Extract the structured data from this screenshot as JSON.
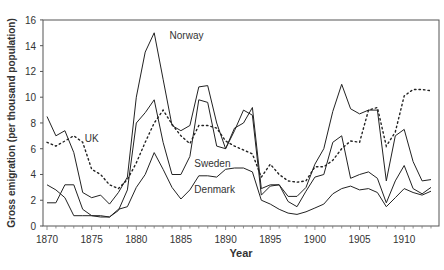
{
  "chart_data": {
    "type": "line",
    "title": "",
    "xlabel": "Year",
    "ylabel": "Gross emigration (per thousand population)",
    "xlim": [
      1870,
      1913
    ],
    "ylim": [
      0,
      16
    ],
    "x_ticks": [
      "1870",
      "1875",
      "1880",
      "1885",
      "1890",
      "1895",
      "1900",
      "1905",
      "1910"
    ],
    "y_ticks": [
      "0",
      "2",
      "4",
      "6",
      "8",
      "10",
      "12",
      "14",
      "16"
    ],
    "grid": false,
    "legend": "inline labels",
    "x": [
      1870,
      1871,
      1872,
      1873,
      1874,
      1875,
      1876,
      1877,
      1878,
      1879,
      1880,
      1881,
      1882,
      1883,
      1884,
      1885,
      1886,
      1887,
      1888,
      1889,
      1890,
      1891,
      1892,
      1893,
      1894,
      1895,
      1896,
      1897,
      1898,
      1899,
      1900,
      1901,
      1902,
      1903,
      1904,
      1905,
      1906,
      1907,
      1908,
      1909,
      1910,
      1911,
      1912,
      1913
    ],
    "series": [
      {
        "name": "Norway",
        "style": "solid",
        "values": [
          8.5,
          7.0,
          7.4,
          5.7,
          2.6,
          2.2,
          2.4,
          1.7,
          2.6,
          3.8,
          10.0,
          13.5,
          15.0,
          11.4,
          7.8,
          7.4,
          7.8,
          10.8,
          10.9,
          8.0,
          6.0,
          7.6,
          8.0,
          9.2,
          2.9,
          3.2,
          3.2,
          2.3,
          2.3,
          3.0,
          4.8,
          6.0,
          8.9,
          11.0,
          9.1,
          8.7,
          9.0,
          9.0,
          3.5,
          7.0,
          7.5,
          5.0,
          3.5,
          3.6
        ]
      },
      {
        "name": "Sweden",
        "style": "solid",
        "values": [
          1.8,
          1.8,
          3.2,
          3.2,
          1.3,
          0.8,
          0.8,
          0.7,
          1.2,
          2.8,
          8.0,
          8.8,
          9.8,
          6.5,
          4.0,
          4.0,
          5.4,
          9.8,
          9.6,
          6.2,
          6.0,
          7.4,
          9.0,
          8.6,
          2.4,
          3.1,
          3.2,
          1.9,
          1.5,
          2.7,
          3.8,
          4.0,
          6.5,
          7.0,
          3.7,
          4.0,
          4.2,
          3.7,
          1.8,
          3.5,
          4.7,
          2.9,
          2.5,
          3.0
        ]
      },
      {
        "name": "Denmark",
        "style": "solid",
        "values": [
          3.2,
          2.8,
          2.2,
          0.8,
          0.8,
          0.8,
          0.7,
          0.7,
          1.3,
          1.5,
          3.0,
          4.0,
          5.7,
          4.4,
          3.0,
          2.1,
          2.8,
          3.9,
          3.9,
          3.8,
          4.4,
          4.5,
          4.5,
          4.2,
          2.0,
          1.7,
          1.3,
          1.0,
          0.9,
          1.1,
          1.4,
          1.7,
          2.5,
          2.9,
          3.1,
          2.8,
          2.9,
          2.6,
          1.5,
          2.2,
          2.9,
          2.6,
          2.4,
          2.7
        ]
      },
      {
        "name": "UK",
        "style": "dotted",
        "values": [
          6.5,
          6.2,
          6.6,
          7.0,
          6.5,
          4.4,
          4.0,
          3.2,
          2.9,
          3.6,
          4.9,
          6.5,
          8.0,
          9.0,
          7.9,
          7.0,
          6.4,
          7.8,
          7.8,
          7.6,
          6.6,
          6.2,
          5.9,
          5.6,
          3.8,
          4.8,
          4.0,
          3.5,
          3.4,
          3.5,
          4.6,
          4.6,
          5.1,
          6.0,
          6.6,
          6.5,
          9.0,
          9.2,
          6.2,
          7.3,
          10.1,
          10.6,
          10.6,
          10.5
        ]
      }
    ],
    "annotations": [
      {
        "text": "Norway",
        "near_year": 1883.5,
        "near_value": 14.8
      },
      {
        "text": "UK",
        "near_year": 1874,
        "near_value": 6.8
      },
      {
        "text": "Sweden",
        "near_year": 1886.5,
        "near_value": 4.9
      },
      {
        "text": "Denmark",
        "near_year": 1886.5,
        "near_value": 2.9
      }
    ]
  }
}
